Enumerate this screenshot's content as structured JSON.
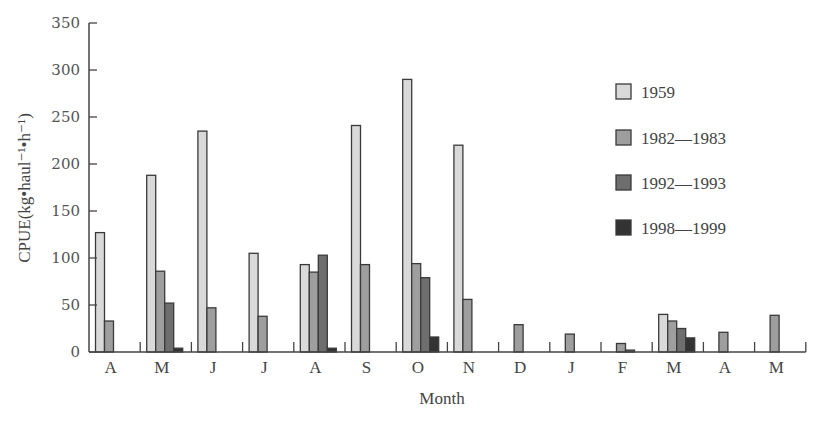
{
  "chart_data": {
    "type": "bar",
    "title": "",
    "xlabel": "Month",
    "ylabel": "CPUE(kg•haul⁻¹•h⁻¹)",
    "ylim": [
      0,
      350
    ],
    "yticks": [
      0,
      50,
      100,
      150,
      200,
      250,
      300,
      350
    ],
    "grid": false,
    "legend_position": "right-inside",
    "categories": [
      "A",
      "M",
      "J",
      "J",
      "A",
      "S",
      "O",
      "N",
      "D",
      "J",
      "F",
      "M",
      "A",
      "M"
    ],
    "series": [
      {
        "name": "1959",
        "color": "#d9d9d9",
        "values": [
          127,
          188,
          235,
          105,
          93,
          241,
          290,
          220,
          0,
          0,
          0,
          40,
          0,
          0
        ]
      },
      {
        "name": "1982—1983",
        "color": "#9e9e9e",
        "values": [
          33,
          86,
          47,
          38,
          85,
          93,
          94,
          56,
          29,
          19,
          9,
          33,
          21,
          39
        ]
      },
      {
        "name": "1992—1993",
        "color": "#6e6e6e",
        "values": [
          0,
          52,
          0,
          0,
          103,
          0,
          79,
          0,
          0,
          0,
          2,
          25,
          0,
          0
        ]
      },
      {
        "name": "1998—1999",
        "color": "#333333",
        "values": [
          0,
          4,
          0,
          0,
          4,
          0,
          16,
          0,
          0,
          0,
          0,
          15,
          0,
          0
        ]
      }
    ]
  }
}
